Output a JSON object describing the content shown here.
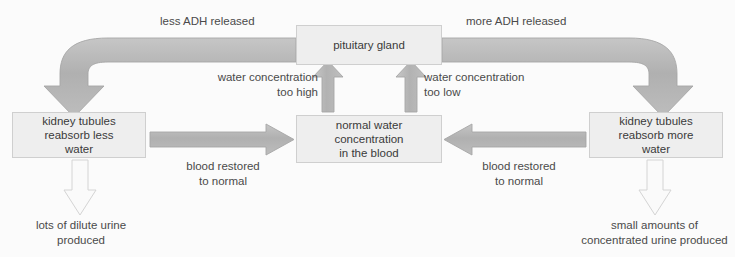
{
  "diagram": {
    "title_fragment_visible": "",
    "colors": {
      "page_background": "#fbfbfb",
      "box_fill": "#eeeeee",
      "box_border": "#cfcfcf",
      "solid_arrow_fill": "#b4b4b4",
      "solid_arrow_stroke": "#a6a6a6",
      "outline_arrow_fill": "#fafafa",
      "outline_arrow_stroke": "#d2d2d2",
      "text": "#3a3a3a"
    },
    "boxes": [
      {
        "id": "pituitary",
        "label": "pituitary gland"
      },
      {
        "id": "normal",
        "label": "normal water\nconcentration\nin the blood"
      },
      {
        "id": "left",
        "label": "kidney tubules\nreabsorb less\nwater"
      },
      {
        "id": "right",
        "label": "kidney tubules\nreabsorb more\nwater"
      }
    ],
    "labels": {
      "less_adh": "less ADH released",
      "more_adh": "more ADH released",
      "conc_too_high": "water concentration\ntoo high",
      "conc_too_low": "water concentration\ntoo low",
      "blood_restored_left": "blood restored\nto normal",
      "blood_restored_right": "blood restored\nto normal",
      "dilute_urine": "lots of dilute urine\nproduced",
      "concentrated_urine": "small amounts of\nconcentrated urine produced"
    },
    "arrows": [
      {
        "id": "pituitary-to-left-tubules",
        "style": "solid-curved",
        "direction": "down-left",
        "label": "less ADH released"
      },
      {
        "id": "pituitary-to-right-tubules",
        "style": "solid-curved",
        "direction": "down-right",
        "label": "more ADH released"
      },
      {
        "id": "normal-to-pituitary-high",
        "style": "solid-straight",
        "direction": "up",
        "label": "water concentration too high"
      },
      {
        "id": "normal-to-pituitary-low",
        "style": "solid-straight",
        "direction": "up",
        "label": "water concentration too low"
      },
      {
        "id": "left-tubules-to-normal",
        "style": "solid-straight",
        "direction": "right",
        "label": "blood restored to normal"
      },
      {
        "id": "right-tubules-to-normal",
        "style": "solid-straight",
        "direction": "left",
        "label": "blood restored to normal"
      },
      {
        "id": "left-tubules-to-urine",
        "style": "outline",
        "direction": "down",
        "label": "lots of dilute urine produced"
      },
      {
        "id": "right-tubules-to-urine",
        "style": "outline",
        "direction": "down",
        "label": "small amounts of concentrated urine produced"
      }
    ]
  }
}
